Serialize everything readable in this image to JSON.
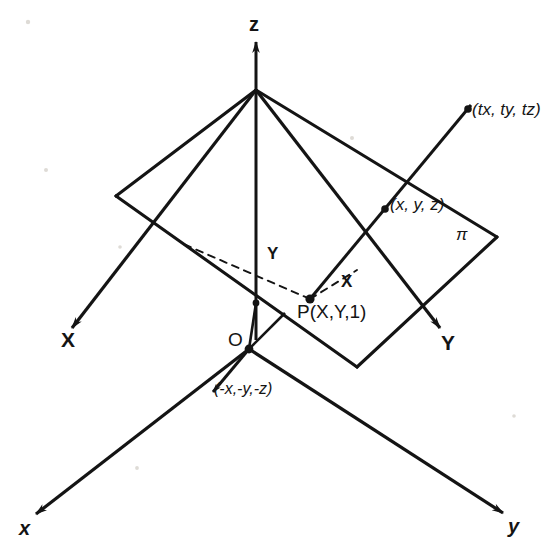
{
  "figure": {
    "kind": "hand-drawn geometry diagram",
    "background_color": "#ffffff",
    "ink_color": "#141414"
  },
  "axes": {
    "z_up": {
      "label": "z",
      "kind": "upper-axis-vertical"
    },
    "X_plane": {
      "label": "X",
      "kind": "plane-axis-left"
    },
    "Y_plane": {
      "label": "Y",
      "kind": "plane-axis-right"
    },
    "x_world": {
      "label": "x",
      "kind": "world-axis-lower-left"
    },
    "y_world": {
      "label": "y",
      "kind": "world-axis-lower-right"
    }
  },
  "points": {
    "origin": {
      "label": "O"
    },
    "plane_point": {
      "label": "P(X,Y,1)"
    },
    "ray_point": {
      "label": "(x, y, z)"
    },
    "scaled_point": {
      "label": "(tx, ty, tz)"
    },
    "negative_point": {
      "label": "(-x,-y,-z)"
    }
  },
  "plane": {
    "label": "π",
    "name": "projective-plane-pi"
  },
  "measures": {
    "x_component": {
      "label": "X"
    },
    "y_component": {
      "label": "Y"
    }
  }
}
